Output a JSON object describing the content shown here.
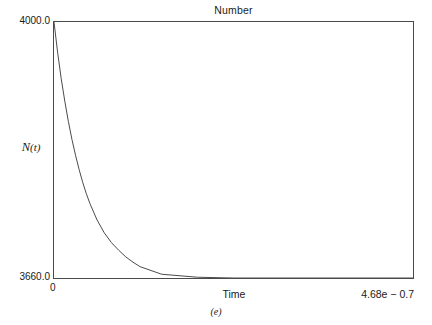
{
  "figure": {
    "caption": "(e)"
  },
  "chart_data": {
    "type": "line",
    "title": "Number",
    "xlabel": "Time",
    "ylabel": "N(t)",
    "ylabel_parts": {
      "symbol": "N",
      "arg": "(t)"
    },
    "xlim": [
      0,
      4.68e-07
    ],
    "ylim": [
      3660.0,
      4000.0
    ],
    "xtick_labels": [
      "0",
      "4.68e − 0.7"
    ],
    "ytick_labels": [
      "3660.0",
      "4000.0"
    ],
    "xtick_values": [
      0,
      4.68e-07
    ],
    "ytick_values": [
      3660.0,
      4000.0
    ],
    "grid": false,
    "legend": "none",
    "line_color": "#4a4a4a",
    "series": [
      {
        "name": "N(t)",
        "description": "Exponential decay of particle number from 4000.0 to steady state 3660.0",
        "x": [
          0.0,
          4.68e-09,
          9.36e-09,
          1.404e-08,
          1.872e-08,
          2.34e-08,
          2.808e-08,
          3.276e-08,
          3.744e-08,
          4.212e-08,
          4.68e-08,
          5.616e-08,
          6.552e-08,
          7.488e-08,
          8.424e-08,
          9.36e-08,
          1.0296e-07,
          1.1232e-07,
          1.404e-07,
          1.872e-07,
          2.34e-07,
          2.808e-07,
          3.276e-07,
          3.744e-07,
          4.212e-07,
          4.68e-07
        ],
        "y": [
          4000.0,
          3960.0,
          3925.0,
          3895.0,
          3868.0,
          3844.0,
          3823.0,
          3804.0,
          3787.0,
          3772.0,
          3759.0,
          3737.0,
          3720.0,
          3707.0,
          3697.0,
          3688.0,
          3681.0,
          3675.0,
          3665.0,
          3661.0,
          3660.0,
          3660.0,
          3660.0,
          3660.0,
          3660.0,
          3660.0
        ]
      }
    ]
  }
}
